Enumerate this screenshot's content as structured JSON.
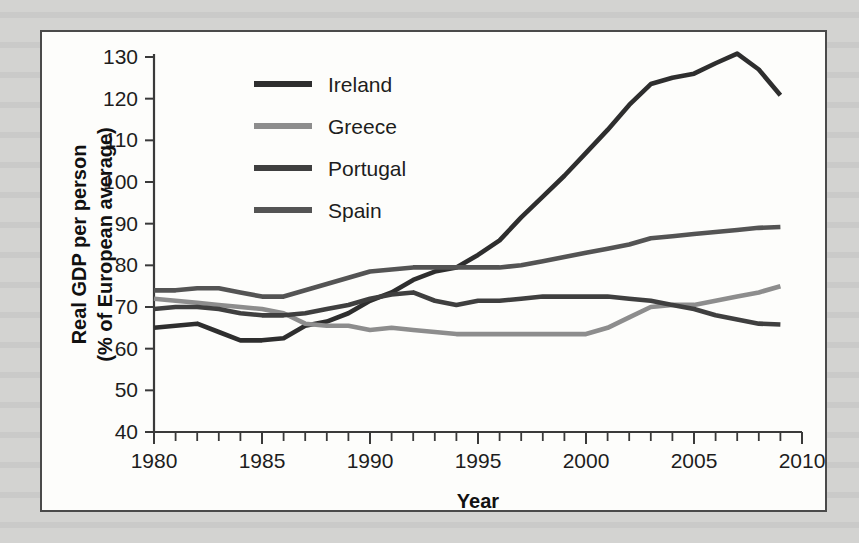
{
  "figure": {
    "background_color": "#d3d3d1",
    "panel_color": "#fdfdfb",
    "border_color": "#4a4a4a"
  },
  "axes": {
    "x_title": "Year",
    "y_title_line1": "Real GDP per person",
    "y_title_line2": "(% of European average)",
    "x_ticks": [
      "1980",
      "1985",
      "1990",
      "1995",
      "2000",
      "2005",
      "2010"
    ],
    "y_ticks": [
      "40",
      "50",
      "60",
      "70",
      "80",
      "90",
      "100",
      "110",
      "120",
      "130"
    ]
  },
  "legend": {
    "items": [
      {
        "label": "Ireland",
        "color": "#2e2e2e"
      },
      {
        "label": "Greece",
        "color": "#8d8d8d"
      },
      {
        "label": "Portugal",
        "color": "#3f3f3f"
      },
      {
        "label": "Spain",
        "color": "#545454"
      }
    ]
  },
  "chart_data": {
    "type": "line",
    "title": "",
    "xlabel": "Year",
    "ylabel": "Real GDP per person (% of European average)",
    "xlim": [
      1980,
      2010
    ],
    "ylim": [
      40,
      130
    ],
    "x_tick_step": 5,
    "x_minor_tick_step": 1,
    "y_tick_step": 10,
    "grid": false,
    "legend_position": "top-left-inside",
    "x": [
      1980,
      1981,
      1982,
      1983,
      1984,
      1985,
      1986,
      1987,
      1988,
      1989,
      1990,
      1991,
      1992,
      1993,
      1994,
      1995,
      1996,
      1997,
      1998,
      1999,
      2000,
      2001,
      2002,
      2003,
      2004,
      2005,
      2006,
      2007,
      2008,
      2009
    ],
    "series": [
      {
        "name": "Ireland",
        "color": "#2e2e2e",
        "values": [
          65.0,
          65.5,
          66.0,
          64.0,
          62.0,
          62.0,
          62.5,
          65.5,
          66.5,
          68.5,
          71.5,
          73.5,
          76.5,
          78.5,
          79.5,
          82.5,
          86.0,
          91.5,
          96.5,
          101.5,
          107.0,
          112.5,
          118.5,
          123.5,
          125.0,
          126.0,
          128.5,
          130.8,
          127.0,
          120.8
        ]
      },
      {
        "name": "Greece",
        "color": "#8d8d8d",
        "values": [
          72.0,
          71.5,
          71.0,
          70.5,
          70.0,
          69.5,
          68.5,
          66.0,
          65.5,
          65.5,
          64.5,
          65.0,
          64.5,
          64.0,
          63.5,
          63.5,
          63.5,
          63.5,
          63.5,
          63.5,
          63.5,
          65.0,
          67.5,
          70.0,
          70.5,
          70.5,
          71.5,
          72.5,
          73.5,
          75.0
        ]
      },
      {
        "name": "Portugal",
        "color": "#3f3f3f",
        "values": [
          69.5,
          70.0,
          70.0,
          69.5,
          68.5,
          68.0,
          68.0,
          68.5,
          69.5,
          70.5,
          72.0,
          73.0,
          73.5,
          71.5,
          70.5,
          71.5,
          71.5,
          72.0,
          72.5,
          72.5,
          72.5,
          72.5,
          72.0,
          71.5,
          70.5,
          69.5,
          68.0,
          67.0,
          66.0,
          65.8
        ]
      },
      {
        "name": "Spain",
        "color": "#545454",
        "values": [
          74.0,
          74.0,
          74.5,
          74.5,
          73.5,
          72.5,
          72.5,
          74.0,
          75.5,
          77.0,
          78.5,
          79.0,
          79.5,
          79.5,
          79.5,
          79.5,
          79.5,
          80.0,
          81.0,
          82.0,
          83.0,
          84.0,
          85.0,
          86.5,
          87.0,
          87.5,
          88.0,
          88.5,
          89.0,
          89.2
        ]
      }
    ]
  }
}
